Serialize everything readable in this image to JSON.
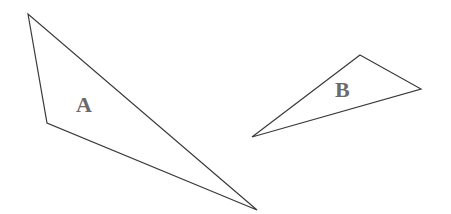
{
  "diagram": {
    "shapes": [
      {
        "id": "A",
        "label": "A",
        "type": "triangle",
        "vertices": [
          [
            28,
            14
          ],
          [
            47,
            123
          ],
          [
            257,
            210
          ]
        ],
        "label_pos": [
          76,
          94
        ]
      },
      {
        "id": "B",
        "label": "B",
        "type": "triangle",
        "vertices": [
          [
            360,
            55
          ],
          [
            421,
            89
          ],
          [
            252,
            137
          ]
        ],
        "label_pos": [
          335,
          79
        ]
      }
    ],
    "colors": {
      "stroke": "#3a3a3a",
      "label": "#6a6a6a",
      "background": "#ffffff"
    }
  }
}
